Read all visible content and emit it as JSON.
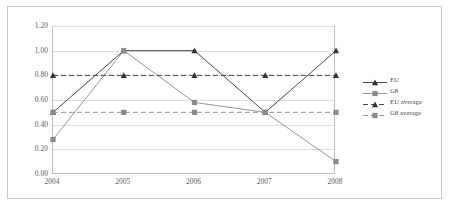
{
  "chart_data": {
    "type": "line",
    "title": "",
    "subtitle": "",
    "xlabel": "",
    "ylabel": "",
    "categories": [
      "2004",
      "2005",
      "2006",
      "2007",
      "2008"
    ],
    "x_tick_labels": [
      "2004",
      "2005",
      "2006",
      "2007",
      "2008"
    ],
    "y_tick_labels": [
      "0.00",
      "0.20",
      "0.40",
      "0.60",
      "0.80",
      "1.00",
      "1.20"
    ],
    "y_tick_values": [
      0.0,
      0.2,
      0.4,
      0.6,
      0.8,
      1.0,
      1.2
    ],
    "ylim": [
      0.0,
      1.2
    ],
    "grid": true,
    "legend_position": "right",
    "series": [
      {
        "name": "EU",
        "values": [
          0.5,
          1.0,
          1.0,
          0.5,
          1.0
        ],
        "style": "solid",
        "marker": "triangle",
        "color": "#333333"
      },
      {
        "name": "G8",
        "values": [
          0.28,
          1.0,
          0.58,
          0.5,
          0.1
        ],
        "style": "solid",
        "marker": "square",
        "color": "#8a8a8a"
      },
      {
        "name": "EU average",
        "values": [
          0.8,
          0.8,
          0.8,
          0.8,
          0.8
        ],
        "style": "dashed",
        "marker": "triangle",
        "color": "#333333"
      },
      {
        "name": "G8 average",
        "values": [
          0.5,
          0.5,
          0.5,
          0.5,
          0.5
        ],
        "style": "dashed",
        "marker": "square",
        "color": "#8a8a8a"
      }
    ]
  },
  "legend": {
    "items": [
      {
        "label": "EU"
      },
      {
        "label": "G8"
      },
      {
        "label": "EU average"
      },
      {
        "label": "G8 average"
      }
    ]
  },
  "colors": {
    "eu": "#333333",
    "g8": "#8a8a8a",
    "grid": "#dededd",
    "axis": "#bdbdbd",
    "frame": "#c9c9c9",
    "tick_text": "#5b5b5b",
    "background": "#ffffff"
  }
}
